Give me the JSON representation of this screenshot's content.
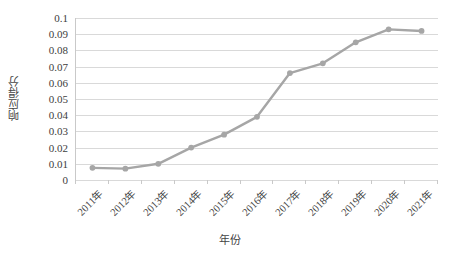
{
  "chart_data": {
    "type": "line",
    "title": "",
    "subtitle": "",
    "xlabel": "年份",
    "ylabel": "响应得分",
    "categories": [
      "2011年",
      "2012年",
      "2013年",
      "2014年",
      "2015年",
      "2016年",
      "2017年",
      "2018年",
      "2019年",
      "2020年",
      "2021年"
    ],
    "series": [
      {
        "name": "响应得分",
        "values": [
          0.0075,
          0.007,
          0.01,
          0.02,
          0.028,
          0.039,
          0.066,
          0.072,
          0.085,
          0.093,
          0.092
        ],
        "color": "#a6a6a6",
        "marker": "circle",
        "line_width": 2.4
      }
    ],
    "ylim": [
      0,
      0.1
    ],
    "ytick_values": [
      0,
      0.01,
      0.02,
      0.03,
      0.04,
      0.05,
      0.06,
      0.07,
      0.08,
      0.09,
      0.1
    ],
    "ytick_labels": [
      "0",
      "0.01",
      "0.02",
      "0.03",
      "0.04",
      "0.05",
      "0.06",
      "0.07",
      "0.08",
      "0.09",
      "0.1"
    ],
    "grid": {
      "horizontal": true,
      "vertical": false,
      "color": "#d9d9d9"
    },
    "legend": {
      "visible": false,
      "position": "none",
      "entries": []
    },
    "axis": {
      "line_color": "#c9c9c9",
      "tick_label_color": "#3d3d3d",
      "xtick_rotation_deg": -45
    },
    "background_color": "#ffffff"
  }
}
